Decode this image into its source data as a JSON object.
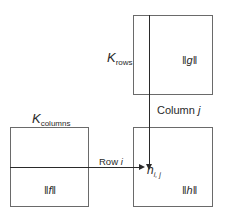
{
  "labels": {
    "k_rows": {
      "base": "K",
      "sub": "rows"
    },
    "k_columns": {
      "base": "K",
      "sub": "columns"
    },
    "column_j": {
      "text": "Column ",
      "var": "j"
    },
    "row_i": {
      "text": "Row ",
      "var": "i"
    },
    "h_ij": {
      "base": "h",
      "sub": "i, j"
    },
    "norm_g": {
      "open": "‖",
      "var": "g",
      "close": "‖"
    },
    "norm_f": {
      "open": "‖",
      "var": "f",
      "close": "‖"
    },
    "norm_h": {
      "open": "‖",
      "var": "h",
      "close": "‖"
    }
  },
  "boxes": [
    {
      "id": "g",
      "x": 133,
      "y": 15,
      "w": 80,
      "h": 80
    },
    {
      "id": "f",
      "x": 10,
      "y": 127,
      "w": 79,
      "h": 80
    },
    {
      "id": "h",
      "x": 133,
      "y": 127,
      "w": 80,
      "h": 80
    }
  ],
  "colors": {
    "line": "#2a2a2a",
    "border": "#6a6a6a"
  }
}
